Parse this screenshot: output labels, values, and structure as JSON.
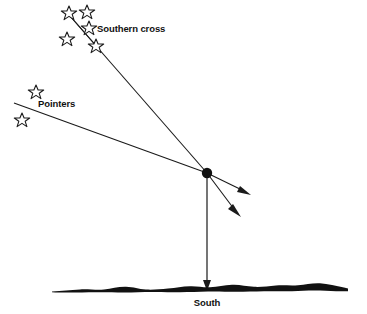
{
  "figure": {
    "type": "astronomy-navigation-diagram",
    "background_color": "#ffffff",
    "ink_color": "#111111",
    "width": 367,
    "height": 314
  },
  "labels": {
    "southern_cross": "Southern cross",
    "pointers": "Pointers",
    "south": "South"
  },
  "constellations": [
    {
      "name": "Southern cross",
      "stars": [
        {
          "cx": 69,
          "cy": 13,
          "r": 7.0
        },
        {
          "cx": 87,
          "cy": 12,
          "r": 7.0
        },
        {
          "cx": 89,
          "cy": 28,
          "r": 7.0
        },
        {
          "cx": 67,
          "cy": 39,
          "r": 7.0
        },
        {
          "cx": 96,
          "cy": 46,
          "r": 7.0
        }
      ],
      "axis_line": {
        "x1": 70,
        "y1": 16,
        "x2": 99,
        "y2": 49
      }
    },
    {
      "name": "Pointers",
      "stars": [
        {
          "cx": 36,
          "cy": 92,
          "r": 7.0
        },
        {
          "cx": 22,
          "cy": 120,
          "r": 7.0
        }
      ]
    }
  ],
  "sight_lines": [
    {
      "name": "southern-cross-sight-line",
      "from": {
        "x": 70,
        "y": 16
      },
      "to": {
        "x": 207,
        "y": 173
      },
      "description": "long axis of the Southern Cross extended to the convergence point"
    },
    {
      "name": "pointers-sight-line",
      "from": {
        "x": 14,
        "y": 103
      },
      "to": {
        "x": 207,
        "y": 173
      },
      "description": "perpendicular bisector direction from the Pointers to the convergence point"
    }
  ],
  "arrows": [
    {
      "name": "southern-cross-arrow",
      "from": {
        "x": 207,
        "y": 173
      },
      "to": {
        "x": 249,
        "y": 194
      }
    },
    {
      "name": "pointers-arrow",
      "from": {
        "x": 207,
        "y": 173
      },
      "to": {
        "x": 239,
        "y": 214
      }
    },
    {
      "name": "south-drop-arrow",
      "from": {
        "x": 207,
        "y": 173
      },
      "to": {
        "x": 207,
        "y": 288
      }
    }
  ],
  "convergence_point": {
    "x": 207,
    "y": 173,
    "r": 5.2
  },
  "horizon": {
    "name": "horizon-silhouette",
    "y_baseline": 292,
    "x_start": 52,
    "x_end": 348
  },
  "label_positions": {
    "southern_cross": {
      "x": 97,
      "y": 32
    },
    "pointers": {
      "x": 38,
      "y": 107
    },
    "south": {
      "x": 207,
      "y": 306
    }
  }
}
